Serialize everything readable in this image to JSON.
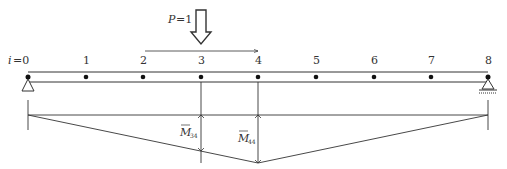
{
  "diagram": {
    "load": {
      "symbol": "P",
      "equals": "=1",
      "node_position": 3,
      "direction": "down",
      "move_direction": "right"
    },
    "beam": {
      "first_label": "i=0",
      "first_var": "i",
      "first_eq": "=0",
      "node_labels": [
        "1",
        "2",
        "3",
        "4",
        "5",
        "6",
        "7",
        "8"
      ],
      "supports": [
        {
          "node": 0,
          "type": "pin"
        },
        {
          "node": 8,
          "type": "roller"
        }
      ]
    },
    "moment_diagram": {
      "apex_node": 4,
      "ordinates": [
        {
          "node": 3,
          "label": "M",
          "subscript": "34"
        },
        {
          "node": 4,
          "label": "M",
          "subscript": "44"
        }
      ]
    },
    "colors": {
      "line": "#333333",
      "fill": "#ffffff"
    }
  }
}
